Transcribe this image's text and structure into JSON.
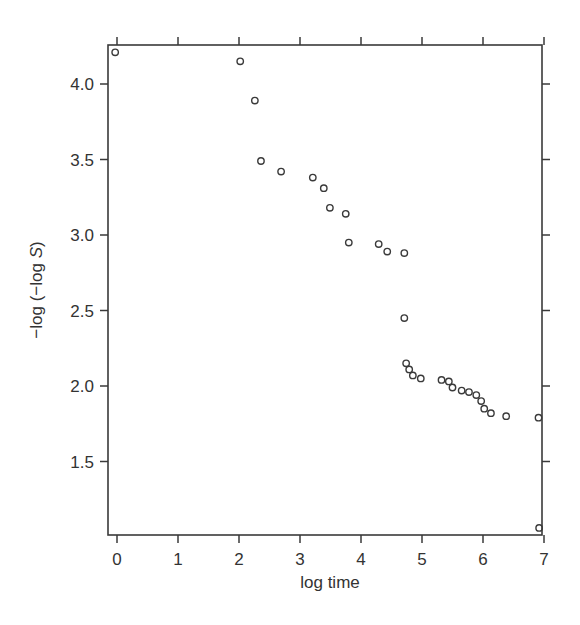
{
  "chart_data": {
    "type": "scatter",
    "title": "",
    "xlabel": "log time",
    "ylabel_parts": {
      "prefix": "−log (−log ",
      "italic": "S",
      "suffix": ")"
    },
    "ylabel": "−log (−log S)",
    "xlim": [
      -0.1,
      7.0
    ],
    "ylim": [
      1.05,
      4.26
    ],
    "x_ticks": [
      0,
      1,
      2,
      3,
      4,
      5,
      6,
      7
    ],
    "x_tick_labels": [
      "0",
      "1",
      "2",
      "3",
      "4",
      "5",
      "6",
      "7"
    ],
    "y_ticks": [
      1.5,
      2.0,
      2.5,
      3.0,
      3.5,
      4.0
    ],
    "y_tick_labels": [
      "1.5",
      "2.0",
      "2.5",
      "3.0",
      "3.5",
      "4.0"
    ],
    "grid": false,
    "legend": null,
    "marker": "open-circle",
    "points": [
      {
        "x": -0.03,
        "y": 4.21
      },
      {
        "x": 2.02,
        "y": 4.15
      },
      {
        "x": 2.26,
        "y": 3.89
      },
      {
        "x": 2.36,
        "y": 3.49
      },
      {
        "x": 2.69,
        "y": 3.42
      },
      {
        "x": 3.21,
        "y": 3.38
      },
      {
        "x": 3.39,
        "y": 3.31
      },
      {
        "x": 3.49,
        "y": 3.18
      },
      {
        "x": 3.75,
        "y": 3.14
      },
      {
        "x": 3.8,
        "y": 2.95
      },
      {
        "x": 4.29,
        "y": 2.94
      },
      {
        "x": 4.43,
        "y": 2.89
      },
      {
        "x": 4.71,
        "y": 2.88
      },
      {
        "x": 4.71,
        "y": 2.45
      },
      {
        "x": 4.74,
        "y": 2.15
      },
      {
        "x": 4.79,
        "y": 2.11
      },
      {
        "x": 4.85,
        "y": 2.07
      },
      {
        "x": 4.98,
        "y": 2.05
      },
      {
        "x": 5.32,
        "y": 2.04
      },
      {
        "x": 5.44,
        "y": 2.03
      },
      {
        "x": 5.5,
        "y": 1.99
      },
      {
        "x": 5.65,
        "y": 1.97
      },
      {
        "x": 5.77,
        "y": 1.96
      },
      {
        "x": 5.89,
        "y": 1.94
      },
      {
        "x": 5.97,
        "y": 1.9
      },
      {
        "x": 6.02,
        "y": 1.85
      },
      {
        "x": 6.13,
        "y": 1.82
      },
      {
        "x": 6.38,
        "y": 1.8
      },
      {
        "x": 6.91,
        "y": 1.79
      },
      {
        "x": 6.92,
        "y": 1.06
      }
    ]
  },
  "colors": {
    "axis": "#3a3a3a",
    "marker": "#3a3a3a",
    "text": "#333333",
    "background": "#ffffff"
  }
}
